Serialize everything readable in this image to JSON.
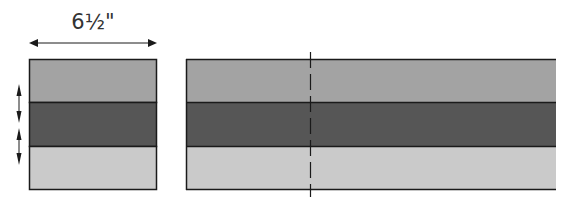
{
  "diagram": {
    "dimension_label": "6½\"",
    "colors": {
      "band_top": "#a3a3a3",
      "band_middle": "#565656",
      "band_bottom": "#cacaca",
      "outline": "#1a1a1a",
      "arrow": "#1a1a1a",
      "cut_line": "#1a1a1a"
    },
    "left_block": {
      "description": "cut segment of strip set",
      "bands": [
        "top",
        "middle",
        "bottom"
      ]
    },
    "right_strip": {
      "description": "strip set with dashed cutting line",
      "bands": [
        "top",
        "middle",
        "bottom"
      ]
    },
    "pressing_arrows": 2
  }
}
